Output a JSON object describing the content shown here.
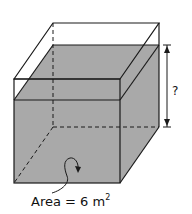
{
  "diagram": {
    "height_label": "?",
    "base_label": "Area = 6 m",
    "base_exponent": "2",
    "colors": {
      "water": "#a9a9a9",
      "edge": "#1a1a1a",
      "background": "#ffffff"
    }
  }
}
